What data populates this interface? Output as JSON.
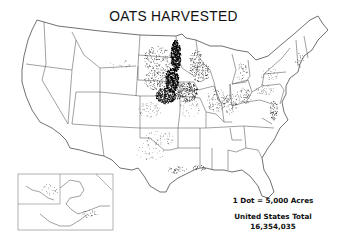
{
  "map": {
    "title": "OATS HARVESTED",
    "type": "dot-density",
    "region": "United States",
    "legend": {
      "scale": "1 Dot = 5,000 Acres",
      "total_label": "United States Total",
      "total_value": "16,354,035"
    },
    "insets": [
      {
        "name": "Alaska"
      }
    ],
    "colors": {
      "background": "#ffffff",
      "dots": "#000000",
      "boundaries": "#555555",
      "text": "#111111"
    },
    "density_regions": [
      {
        "area": "Minnesota / eastern Dakotas (Red River Valley)",
        "density": "very high"
      },
      {
        "area": "Iowa",
        "density": "very high"
      },
      {
        "area": "Wisconsin",
        "density": "high"
      },
      {
        "area": "South Dakota / Nebraska east",
        "density": "high"
      },
      {
        "area": "Illinois / Indiana / Ohio",
        "density": "moderate"
      },
      {
        "area": "Michigan",
        "density": "moderate"
      },
      {
        "area": "Pennsylvania / New York",
        "density": "low-moderate"
      },
      {
        "area": "Maryland / Delaware / Virginia coast",
        "density": "moderate"
      },
      {
        "area": "Texas / Oklahoma",
        "density": "low"
      },
      {
        "area": "Gulf Coast",
        "density": "low"
      },
      {
        "area": "Western states",
        "density": "very low"
      }
    ]
  }
}
